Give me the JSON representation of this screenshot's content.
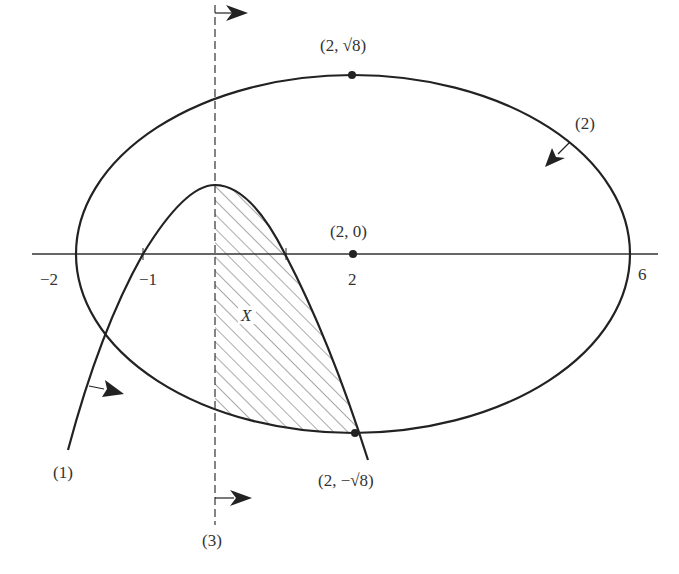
{
  "diagram": {
    "type": "region-bounded-by-curves",
    "colors": {
      "stroke": "#222222",
      "hatch": "#555555",
      "text": "#333333"
    },
    "axis": {
      "ticks": [
        {
          "value": -2,
          "label": "−2"
        },
        {
          "value": -1,
          "label": "−1"
        },
        {
          "value": 2,
          "label": "2"
        },
        {
          "value": 6,
          "label": "6"
        }
      ]
    },
    "points": {
      "top": "(2, √8)",
      "center": "(2, 0)",
      "bottom": "(2, −√8)"
    },
    "curves": {
      "parabola_label": "(1)",
      "ellipse_label": "(2)",
      "line_label": "(3)"
    },
    "region_label": "X"
  }
}
